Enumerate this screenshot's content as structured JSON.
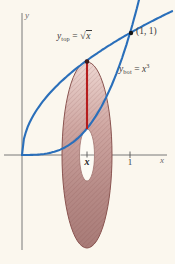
{
  "labels": {
    "top_curve": {
      "base": "y",
      "sub": "top",
      "eq": " = ",
      "radical": "√",
      "arg": "x"
    },
    "bot_curve": {
      "base": "y",
      "sub": "bot",
      "eq": " = ",
      "var": "x",
      "exp": "3"
    },
    "intersection_point": "(1, 1)",
    "x_axis": "x",
    "y_axis": "y",
    "tick_one": "1",
    "tick_x": "x"
  },
  "colors": {
    "curve_blue": "#2a6fba",
    "radius_line_red": "#b51d1d",
    "washer_edge": "#8a5450",
    "washer_fill_light": "#eed7d2",
    "washer_fill_dark": "#a87b77",
    "hole_fill": "#fdfbf4",
    "axis_gray": "#787878",
    "paper": "#fbf7ee"
  },
  "chart_data": {
    "type": "line",
    "xlabel": "x",
    "ylabel": "y",
    "x_ticks": [
      "x",
      "1"
    ],
    "series": [
      {
        "name": "y_top = √x",
        "x": [
          0,
          0.2,
          0.4,
          0.6,
          0.8,
          1.0
        ],
        "y": [
          0,
          0.447,
          0.632,
          0.775,
          0.894,
          1.0
        ]
      },
      {
        "name": "y_bot = x³",
        "x": [
          0,
          0.2,
          0.4,
          0.6,
          0.8,
          1.0
        ],
        "y": [
          0,
          0.008,
          0.064,
          0.216,
          0.512,
          1.0
        ]
      }
    ],
    "annotations": [
      {
        "label": "(1, 1)",
        "x": 1,
        "y": 1
      },
      {
        "label": "x",
        "x": 0.6,
        "y": 0
      }
    ],
    "washer": {
      "at_x": 0.6,
      "outer_radius": 0.775,
      "inner_radius": 0.216
    },
    "axis_ranges": {
      "x": [
        0,
        1.4
      ],
      "y_shown": [
        -0.77,
        1.17
      ]
    },
    "grid": false,
    "legend_position": "inline-curve-labels"
  }
}
